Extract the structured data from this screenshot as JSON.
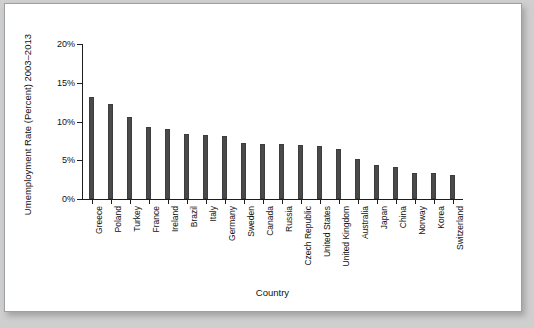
{
  "chart_data": {
    "type": "bar",
    "title": "",
    "xlabel": "Country",
    "ylabel": "Umemployment Rate (Percent) 2003–2013",
    "categories": [
      "Greece",
      "Poland",
      "Turkey",
      "France",
      "Ireland",
      "Brazil",
      "Italy",
      "Germany",
      "Sweden",
      "Canada",
      "Russia",
      "Czech Republic",
      "United States",
      "United Kingdom",
      "Australia",
      "Japan",
      "China",
      "Norway",
      "Korea",
      "Switzerland"
    ],
    "values": [
      13.2,
      12.3,
      10.6,
      9.3,
      9.0,
      8.4,
      8.3,
      8.1,
      7.2,
      7.1,
      7.1,
      7.0,
      6.9,
      6.4,
      5.1,
      4.4,
      4.1,
      3.4,
      3.4,
      3.1
    ],
    "ylim": [
      0,
      20
    ],
    "ytick_values": [
      0,
      5,
      10,
      15,
      20
    ],
    "ytick_labels": [
      "0%",
      "5%",
      "10%",
      "15%",
      "20%"
    ],
    "grid": false,
    "legend": null,
    "bar_color": "#4a4a4a",
    "axis_color": "#1d1d1d",
    "background_color": "#ffffff"
  }
}
